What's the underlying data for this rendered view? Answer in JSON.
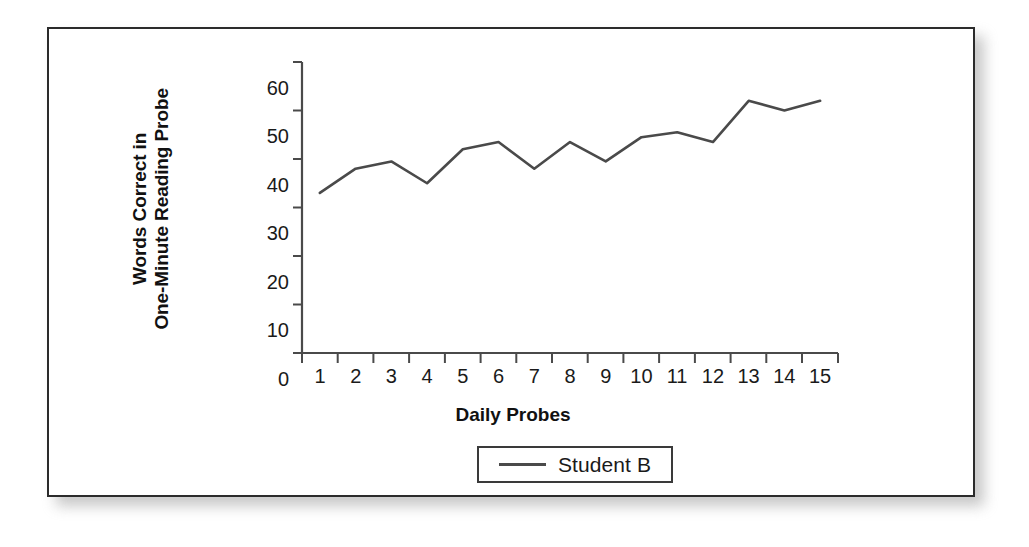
{
  "chart_data": {
    "type": "line",
    "title": "",
    "xlabel": "Daily Probes",
    "ylabel_line1": "Words Correct in",
    "ylabel_line2": "One-Minute Reading Probe",
    "categories": [
      "1",
      "2",
      "3",
      "4",
      "5",
      "6",
      "7",
      "8",
      "9",
      "10",
      "11",
      "12",
      "13",
      "14",
      "15"
    ],
    "series": [
      {
        "name": "Student B",
        "values": [
          33,
          38,
          39.5,
          35,
          42,
          43.5,
          38,
          43.5,
          39.5,
          44.5,
          45.5,
          43.5,
          52,
          50,
          52
        ],
        "color": "#4a4a4a"
      }
    ],
    "ylim": [
      0,
      60
    ],
    "yticks": [
      "0",
      "10",
      "20",
      "30",
      "40",
      "50",
      "60"
    ],
    "ytick_values": [
      0,
      10,
      20,
      30,
      40,
      50,
      60
    ],
    "grid": false,
    "legend_position": "bottom",
    "legend_entries": [
      "Student B"
    ]
  },
  "figure": {
    "border_color": "#2b2b2b",
    "background": "#ffffff",
    "line_color": "#4a4a4a"
  }
}
